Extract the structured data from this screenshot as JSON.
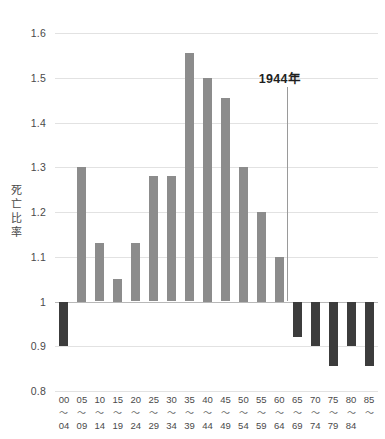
{
  "chart_data": {
    "type": "bar",
    "title": "",
    "subtitle": "",
    "xlabel": "",
    "ylabel": "死亡比率",
    "ylim": [
      0.8,
      1.6
    ],
    "ytick_labels": [
      "1.6",
      "1.5",
      "1.4",
      "1.3",
      "1.2",
      "1.1",
      "1",
      "0.9",
      "0.8"
    ],
    "ytick_values": [
      1.6,
      1.5,
      1.4,
      1.3,
      1.2,
      1.1,
      1.0,
      0.9,
      0.8
    ],
    "baseline": 1.0,
    "grid": true,
    "legend": "none",
    "categories": [
      "00〜04",
      "05〜09",
      "10〜14",
      "15〜19",
      "20〜24",
      "25〜29",
      "30〜34",
      "35〜39",
      "40〜44",
      "45〜49",
      "50〜54",
      "55〜59",
      "60〜64",
      "65〜69",
      "70〜74",
      "75〜79",
      "80〜84",
      "85〜"
    ],
    "category_parts": [
      {
        "start": "00",
        "tilde": "〜",
        "end": "04"
      },
      {
        "start": "05",
        "tilde": "〜",
        "end": "09"
      },
      {
        "start": "10",
        "tilde": "〜",
        "end": "14"
      },
      {
        "start": "15",
        "tilde": "〜",
        "end": "19"
      },
      {
        "start": "20",
        "tilde": "〜",
        "end": "24"
      },
      {
        "start": "25",
        "tilde": "〜",
        "end": "29"
      },
      {
        "start": "30",
        "tilde": "〜",
        "end": "34"
      },
      {
        "start": "35",
        "tilde": "〜",
        "end": "39"
      },
      {
        "start": "40",
        "tilde": "〜",
        "end": "44"
      },
      {
        "start": "45",
        "tilde": "〜",
        "end": "49"
      },
      {
        "start": "50",
        "tilde": "〜",
        "end": "54"
      },
      {
        "start": "55",
        "tilde": "〜",
        "end": "59"
      },
      {
        "start": "60",
        "tilde": "〜",
        "end": "64"
      },
      {
        "start": "65",
        "tilde": "〜",
        "end": "69"
      },
      {
        "start": "70",
        "tilde": "〜",
        "end": "74"
      },
      {
        "start": "75",
        "tilde": "〜",
        "end": "79"
      },
      {
        "start": "80",
        "tilde": "〜",
        "end": "84"
      },
      {
        "start": "85",
        "tilde": "〜",
        "end": ""
      }
    ],
    "values": [
      0.9,
      1.3,
      1.13,
      1.05,
      1.13,
      1.28,
      1.28,
      1.555,
      1.5,
      1.455,
      1.3,
      1.2,
      1.1,
      0.92,
      0.9,
      0.855,
      0.9,
      0.855
    ],
    "colors": {
      "above_baseline": "#8c8c8c",
      "below_baseline": "#3c3c3c",
      "gridline": "#e2e2e2",
      "baseline_line": "#b8b8b8",
      "text": "#4a4a4a",
      "annotation_text": "#1f1f1f",
      "annotation_line": "#9a9a9a"
    },
    "annotations": [
      {
        "label": "1944年",
        "category_boundary_after": "60〜64",
        "value_top": 1.48,
        "value_bottom": 1.0
      }
    ]
  }
}
